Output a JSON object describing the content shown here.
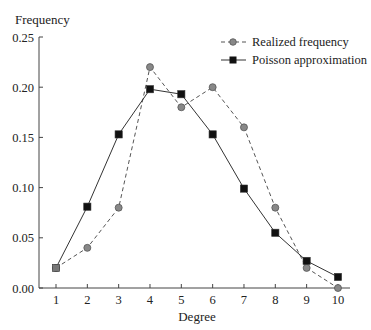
{
  "chart_data": {
    "type": "line",
    "title": "",
    "xlabel": "Degree",
    "ylabel": "Frequency",
    "x": [
      1,
      2,
      3,
      4,
      5,
      6,
      7,
      8,
      9,
      10
    ],
    "xticks": [
      "1",
      "2",
      "3",
      "4",
      "5",
      "6",
      "7",
      "8",
      "9",
      "10"
    ],
    "yticks": [
      "0.00",
      "0.05",
      "0.10",
      "0.15",
      "0.20",
      "0.25"
    ],
    "ylim": [
      0,
      0.25
    ],
    "xlim": [
      1,
      10
    ],
    "grid": false,
    "legend_position": "upper right",
    "series": [
      {
        "name": "Realized frequency",
        "style": "dashed",
        "marker": "circle",
        "color": "#777777",
        "values": [
          0.02,
          0.04,
          0.08,
          0.22,
          0.18,
          0.2,
          0.16,
          0.08,
          0.02,
          0.0
        ]
      },
      {
        "name": "Poisson approximation",
        "style": "solid",
        "marker": "square",
        "color": "#111111",
        "values": [
          0.02,
          0.081,
          0.153,
          0.198,
          0.193,
          0.153,
          0.099,
          0.055,
          0.027,
          0.011
        ]
      }
    ]
  },
  "legend": {
    "items": [
      {
        "label": "Realized frequency"
      },
      {
        "label": "Poisson approximation"
      }
    ]
  },
  "axes": {
    "xlabel": "Degree",
    "ylabel": "Frequency"
  }
}
